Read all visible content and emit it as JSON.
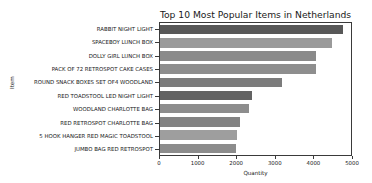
{
  "top_strip_text": "",
  "chart_data": {
    "type": "bar",
    "orientation": "horizontal",
    "title": "Top 10 Most Popular Items in Netherlands",
    "xlabel": "Quantity",
    "ylabel": "Item",
    "xlim": [
      0,
      5000
    ],
    "xticks": [
      "0",
      "1000",
      "2000",
      "3000",
      "4000",
      "5000"
    ],
    "xtick_values": [
      0,
      1000,
      2000,
      3000,
      4000,
      5000
    ],
    "grid": false,
    "legend": null,
    "categories": [
      "RABBIT NIGHT LIGHT",
      "SPACEBOY LUNCH BOX",
      "DOLLY GIRL LUNCH BOX",
      "PACK OF 72 RETROSPOT CAKE CASES",
      "ROUND SNACK BOXES SET OF4 WOODLAND",
      "RED TOADSTOOL LED NIGHT LIGHT",
      "WOODLAND CHARLOTTE BAG",
      "RED RETROSPOT CHARLOTTE BAG",
      "5 HOOK HANGER RED MAGIC TOADSTOOL",
      "JUMBO BAG RED RETROSPOT"
    ],
    "values": [
      4790,
      4510,
      4090,
      4080,
      3190,
      2410,
      2330,
      2100,
      2010,
      2000
    ],
    "bar_colors": [
      "#585858",
      "#9a9a9a",
      "#8a8a8a",
      "#8e8e8e",
      "#7c7c7c",
      "#636363",
      "#8d8d8d",
      "#838383",
      "#9e9e9e",
      "#8c8c8c"
    ]
  }
}
